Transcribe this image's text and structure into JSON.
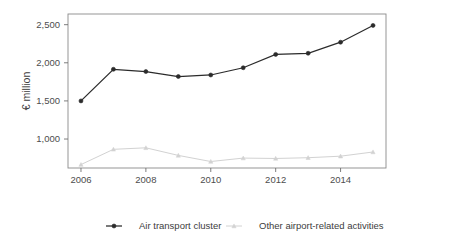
{
  "chart_data": {
    "type": "line",
    "title": "",
    "subtitle": "",
    "xlabel": "",
    "ylabel": "€ million",
    "x": [
      2006,
      2007,
      2008,
      2009,
      2010,
      2011,
      2012,
      2013,
      2014,
      2015
    ],
    "xtick_labels": [
      "2006",
      "2008",
      "2010",
      "2012",
      "2014"
    ],
    "xtick_values": [
      2006,
      2008,
      2010,
      2012,
      2014
    ],
    "xlim": [
      2005.6,
      2015.4
    ],
    "ytick_labels": [
      "1,000",
      "1,500",
      "2,000",
      "2,500"
    ],
    "ytick_values": [
      1000,
      1500,
      2000,
      2500
    ],
    "ylim": [
      620,
      2640
    ],
    "grid": false,
    "legend_position": "bottom-center",
    "series": [
      {
        "name": "Air transport cluster",
        "color": "#2b2b2b",
        "marker": "circle",
        "values": [
          1500,
          1915,
          1885,
          1820,
          1840,
          1935,
          2110,
          2125,
          2270,
          2490
        ]
      },
      {
        "name": "Other airport-related activities",
        "color": "#d2d2d2",
        "marker": "triangle",
        "values": [
          665,
          865,
          885,
          785,
          705,
          750,
          745,
          755,
          775,
          830
        ]
      }
    ]
  },
  "legend": {
    "items": [
      {
        "label": "Air transport cluster"
      },
      {
        "label": "Other airport-related activities"
      }
    ]
  }
}
